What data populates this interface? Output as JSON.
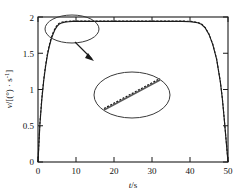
{
  "figure": {
    "caption": "",
    "background": "#ffffff",
    "ink": "#1a1a1a"
  },
  "chart_data": {
    "type": "line",
    "title": "",
    "xlabel": "t/s",
    "ylabel": "v/[(°) · s⁻¹]",
    "xlim": [
      0,
      50
    ],
    "ylim": [
      0,
      2
    ],
    "xticks": [
      0,
      10,
      20,
      30,
      40,
      50
    ],
    "yticks": [
      0,
      0.5,
      1,
      1.5,
      2
    ],
    "xticklabels": [
      "0",
      "10",
      "20",
      "30",
      "40",
      "50"
    ],
    "yticklabels": [
      "0",
      "0.5",
      "1",
      "1.5",
      "2"
    ],
    "grid": false,
    "legend": false,
    "tick_direction": "in",
    "frame": "box",
    "series": [
      {
        "name": "actual",
        "style": "solid",
        "color": "#1a1a1a",
        "x": [
          0,
          0.5,
          1,
          1.5,
          2,
          2.5,
          3,
          3.5,
          4,
          4.5,
          5,
          5.5,
          6,
          7,
          8,
          9,
          10,
          12,
          15,
          20,
          25,
          30,
          35,
          38,
          40,
          41,
          42,
          43,
          44,
          45,
          46,
          47,
          48,
          48.5,
          49,
          49.5,
          50
        ],
        "y": [
          0,
          0.52,
          0.86,
          1.12,
          1.32,
          1.48,
          1.6,
          1.7,
          1.77,
          1.83,
          1.87,
          1.9,
          1.915,
          1.93,
          1.935,
          1.94,
          1.94,
          1.94,
          1.94,
          1.94,
          1.94,
          1.94,
          1.94,
          1.94,
          1.935,
          1.93,
          1.92,
          1.9,
          1.85,
          1.76,
          1.62,
          1.42,
          1.1,
          0.88,
          0.6,
          0.3,
          0
        ]
      },
      {
        "name": "reference",
        "style": "dashed",
        "color": "#1a1a1a",
        "x": [
          0,
          0.5,
          1,
          1.5,
          2,
          2.5,
          3,
          3.5,
          4,
          4.5,
          5,
          5.5,
          6,
          7,
          8,
          9,
          10,
          12,
          15,
          20,
          25,
          30,
          35,
          38,
          40,
          41,
          42,
          43,
          44,
          45,
          46,
          47,
          48,
          48.5,
          49,
          49.5,
          50
        ],
        "y": [
          0,
          0.54,
          0.88,
          1.14,
          1.34,
          1.5,
          1.62,
          1.72,
          1.79,
          1.845,
          1.885,
          1.912,
          1.925,
          1.938,
          1.942,
          1.945,
          1.945,
          1.945,
          1.945,
          1.945,
          1.945,
          1.945,
          1.945,
          1.945,
          1.94,
          1.935,
          1.925,
          1.905,
          1.855,
          1.765,
          1.625,
          1.425,
          1.105,
          0.885,
          0.605,
          0.305,
          0
        ]
      }
    ],
    "annotations": [
      {
        "name": "highlight-ellipse",
        "type": "ellipse",
        "shape": "ellipse",
        "note": "marks the overlap of the two curves near the plateau onset"
      },
      {
        "name": "callout-arrow",
        "type": "arrow",
        "note": "points from highlight ellipse to magnified inset"
      },
      {
        "name": "magnified-inset",
        "type": "ellipse",
        "note": "enlarged view showing the dashed reference curve lying on the solid curve"
      }
    ]
  }
}
